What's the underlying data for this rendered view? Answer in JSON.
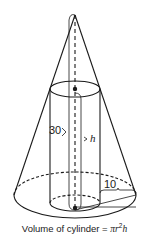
{
  "diagram": {
    "shapes": [
      "cone",
      "cylinder"
    ],
    "labels": {
      "cylinder_radius_segment": "30",
      "height_marker": "h",
      "cone_radius_minus_cylinder_radius": "10"
    },
    "caption": {
      "prefix": "Volume of cylinder = ",
      "pi": "π",
      "r": "r",
      "exp": "2",
      "h": "h"
    },
    "colors": {
      "stroke": "#1a1a1a",
      "background": "#ffffff"
    }
  }
}
